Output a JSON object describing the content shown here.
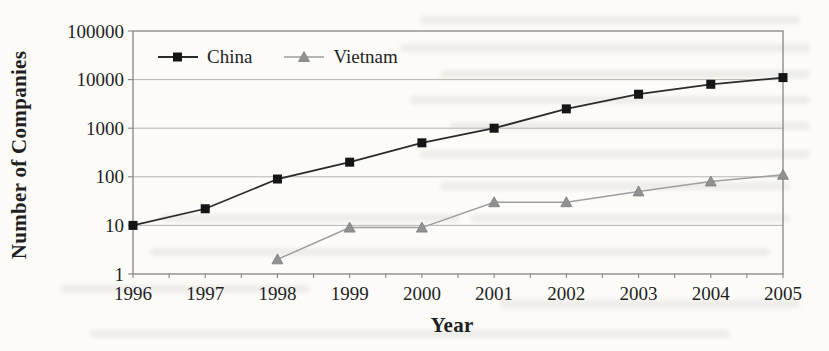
{
  "chart_data": {
    "type": "line",
    "title": "",
    "xlabel": "Year",
    "ylabel": "Number of Companies",
    "x": [
      1996,
      1997,
      1998,
      1999,
      2000,
      2001,
      2002,
      2003,
      2004,
      2005
    ],
    "y_scale": "log",
    "ylim": [
      1,
      100000
    ],
    "y_ticks": [
      1,
      10,
      100,
      1000,
      10000,
      100000
    ],
    "grid": "horizontal gridlines at each decade",
    "legend_position": "inside top-left, no border",
    "series": [
      {
        "name": "China",
        "marker": "square",
        "line_color": "#2b2b2b",
        "marker_color": "#151515",
        "values": [
          10,
          22,
          90,
          200,
          500,
          1000,
          2500,
          5000,
          8000,
          11000
        ]
      },
      {
        "name": "Vietnam",
        "marker": "triangle",
        "line_color": "#9e9e9e",
        "marker_color": "#919191",
        "values": [
          null,
          null,
          2,
          9,
          9,
          30,
          30,
          50,
          80,
          110
        ]
      }
    ],
    "colors": {
      "gridline": "#b6b4b0",
      "frame": "#868584",
      "text": "#1f1f1f",
      "paper": "#fcfbf8"
    }
  }
}
